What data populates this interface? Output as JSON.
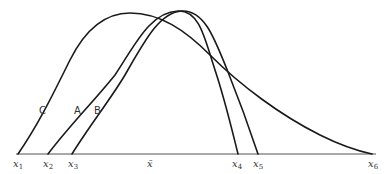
{
  "diagram": {
    "type": "distribution-curves",
    "curve_labels": {
      "C": "C",
      "A": "A",
      "B": "B"
    },
    "axis_ticks": [
      {
        "base": "x",
        "sub": "1"
      },
      {
        "base": "x",
        "sub": "2"
      },
      {
        "base": "x",
        "sub": "3"
      },
      {
        "base": "x̄",
        "sub": ""
      },
      {
        "base": "x",
        "sub": "4"
      },
      {
        "base": "x",
        "sub": "5"
      },
      {
        "base": "x",
        "sub": "6"
      }
    ],
    "curves": [
      {
        "name": "A",
        "start": "x2",
        "end": "x4",
        "shape": "symmetric, narrow, tall"
      },
      {
        "name": "B",
        "start": "x3",
        "end": "x5",
        "shape": "symmetric, narrow, tall (shifted right of A)"
      },
      {
        "name": "C",
        "start": "x1",
        "end": "x6",
        "shape": "skewed right, long tail"
      }
    ],
    "colors": {
      "stroke": "#1a1a1a",
      "axis": "#555555",
      "text": "#333333",
      "background": "#ffffff"
    }
  }
}
